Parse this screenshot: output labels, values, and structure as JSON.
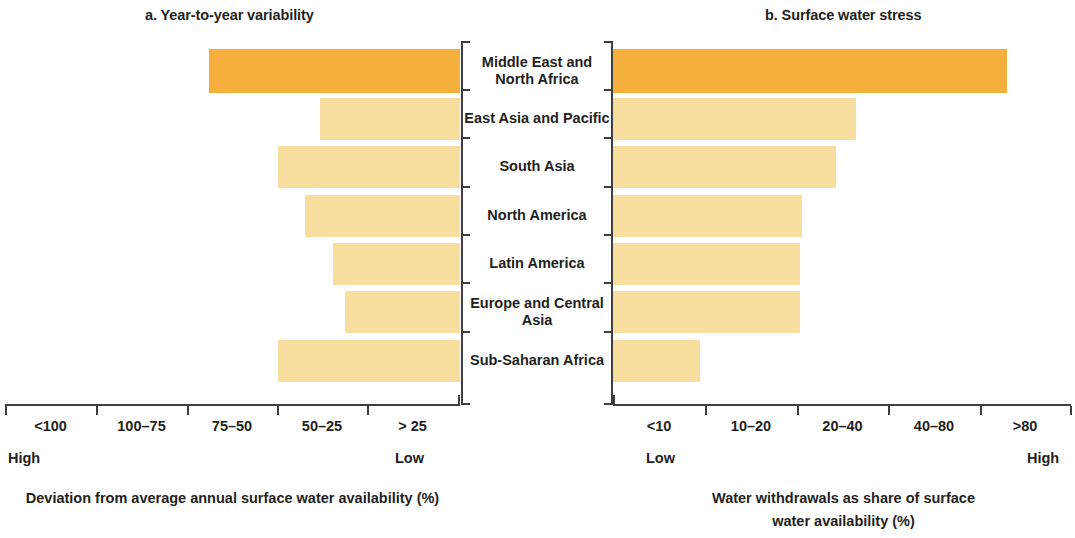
{
  "figure": {
    "panels": [
      {
        "id": "a",
        "title": "a. Year-to-year variability"
      },
      {
        "id": "b",
        "title": "b. Surface water stress"
      }
    ]
  },
  "categories": [
    "Middle East and\nNorth Africa",
    "East Asia and Pacific",
    "South Asia",
    "North America",
    "Latin America",
    "Europe and Central\nAsia",
    "Sub-Saharan Africa"
  ],
  "panel_a": {
    "title": "a. Year-to-year variability",
    "axis_caption": "Deviation from average annual surface water availability (%)",
    "tick_labels": [
      "<100",
      "100–75",
      "75–50",
      "50–25",
      "> 25"
    ],
    "left_end_label": "High",
    "right_end_label": "Low",
    "direction": "right-to-left"
  },
  "panel_b": {
    "title": "b. Surface water stress",
    "axis_caption": "Water withdrawals as share of surface\nwater availability (%)",
    "tick_labels": [
      "<10",
      "10–20",
      "20–40",
      "40–80",
      ">80"
    ],
    "left_end_label": "Low",
    "right_end_label": "High",
    "direction": "left-to-right"
  },
  "colors": {
    "high_stress_bar": "#f5af3d",
    "normal_bar": "#f7dd9e",
    "axis": "#3f3f3f",
    "text": "#231f20",
    "background": "#ffffff"
  },
  "chart_data": [
    {
      "type": "bar",
      "orientation": "horizontal",
      "panel": "a",
      "title": "a. Year-to-year variability",
      "xlabel": "Deviation from average annual surface water availability (%)",
      "ylabel": "",
      "grid": false,
      "legend": "none",
      "axis_direction": "reversed",
      "xtick_labels": [
        "<100",
        "100–75",
        "75–50",
        "50–25",
        "> 25"
      ],
      "axis_end_labels": {
        "left": "High",
        "right": "Low"
      },
      "categories": [
        "Middle East and North Africa",
        "East Asia and Pacific",
        "South Asia",
        "North America",
        "Latin America",
        "Europe and Central Asia",
        "Sub-Saharan Africa"
      ],
      "values": [
        110,
        77,
        100,
        86,
        78,
        75,
        100
      ],
      "value_units": "bar length in percent-deviation scale (reversed axis)",
      "bar_colors": [
        "#f5af3d",
        "#f7dd9e",
        "#f7dd9e",
        "#f7dd9e",
        "#f7dd9e",
        "#f7dd9e",
        "#f7dd9e"
      ]
    },
    {
      "type": "bar",
      "orientation": "horizontal",
      "panel": "b",
      "title": "b. Surface water stress",
      "xlabel": "Water withdrawals as share of surface water availability (%)",
      "ylabel": "",
      "grid": false,
      "legend": "none",
      "axis_direction": "normal",
      "xtick_labels": [
        "<10",
        "10–20",
        "20–40",
        "40–80",
        ">80"
      ],
      "axis_end_labels": {
        "left": "Low",
        "right": "High"
      },
      "categories": [
        "Middle East and North Africa",
        "East Asia and Pacific",
        "South Asia",
        "North America",
        "Latin America",
        "Europe and Central Asia",
        "Sub-Saharan Africa"
      ],
      "values": [
        86,
        53,
        49,
        41,
        41,
        41,
        19
      ],
      "value_units": "water withdrawals as share of surface water availability (%)",
      "bar_colors": [
        "#f5af3d",
        "#f7dd9e",
        "#f7dd9e",
        "#f7dd9e",
        "#f7dd9e",
        "#f7dd9e",
        "#f7dd9e"
      ]
    }
  ],
  "geometry": {
    "row_tops": [
      8,
      57,
      105,
      154,
      202,
      250,
      299
    ],
    "row_heights": [
      44,
      42,
      42,
      42,
      42,
      42,
      42
    ],
    "panel_a_bar_left": [
      209,
      320,
      278,
      305,
      333,
      345,
      278
    ],
    "panel_a_bar_right": 460,
    "panel_b_bar_left": 613,
    "panel_b_bar_right": [
      1007,
      856,
      836,
      802,
      800,
      800,
      700
    ],
    "panel_a_ticks": [
      5,
      96,
      187,
      277,
      367,
      458
    ],
    "panel_b_ticks": [
      613,
      705,
      797,
      888,
      980,
      1070
    ],
    "cat_tick_tops": [
      0,
      48,
      96,
      145,
      193,
      241,
      290,
      362
    ]
  }
}
